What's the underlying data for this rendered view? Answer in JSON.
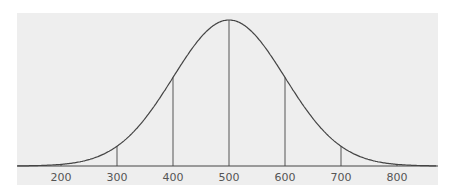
{
  "chart_data": {
    "type": "line",
    "title": "",
    "xlabel": "",
    "ylabel": "",
    "mean": 500,
    "sd": 100,
    "categories": [
      "200",
      "300",
      "400",
      "500",
      "600",
      "700",
      "800"
    ],
    "x": [
      200,
      300,
      400,
      500,
      600,
      700,
      800
    ],
    "values": [
      0.011,
      0.135,
      0.607,
      1.0,
      0.607,
      0.135,
      0.011
    ],
    "xlim": [
      120,
      870
    ],
    "grid": false,
    "legend": null
  },
  "colors": {
    "panel": "#eeeeee",
    "line": "#444444",
    "text": "#555555"
  }
}
